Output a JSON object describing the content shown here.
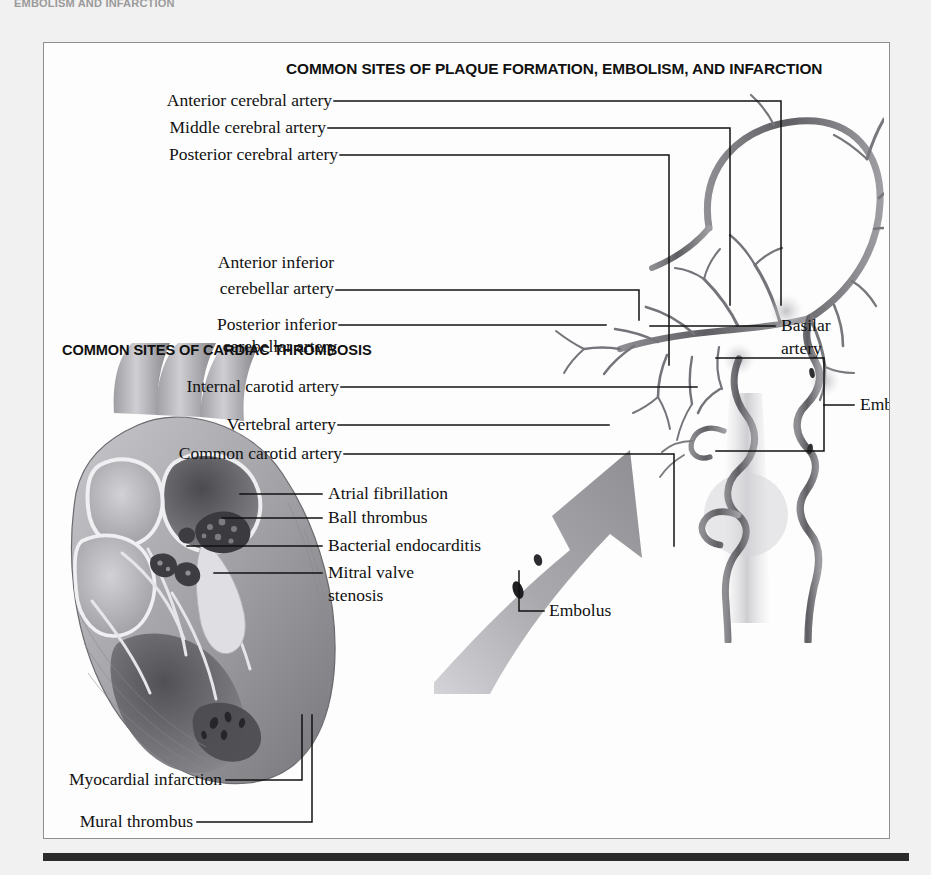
{
  "page": {
    "running_head": "EMBOLISM AND INFARCTION",
    "background_color": "#f1f1f1",
    "frame_color": "#8f8f93",
    "paper_color": "#fdfdfd",
    "rule_color": "#2b2b2b",
    "artery_color": "#6e6e72",
    "arrow_color": "#9a9a9e"
  },
  "headings": {
    "plaque": "COMMON SITES OF PLAQUE FORMATION, EMBOLISM, AND INFARCTION",
    "cardiac": "COMMON SITES OF CARDIAC THROMBOSIS"
  },
  "cerebral_labels": [
    {
      "text": "Anterior cerebral artery"
    },
    {
      "text": "Middle cerebral artery"
    },
    {
      "text": "Posterior cerebral artery"
    }
  ],
  "cerebellar_labels": [
    {
      "line1": "Anterior inferior",
      "line2": "cerebellar artery"
    },
    {
      "line1": "Posterior inferior",
      "line2": "cerebellar artery"
    }
  ],
  "carotid_labels": [
    {
      "text": "Internal carotid artery"
    },
    {
      "text": "Vertebral artery"
    },
    {
      "text": "Common carotid artery"
    }
  ],
  "right_labels": [
    {
      "line1": "Basilar",
      "line2": "artery"
    },
    {
      "line1": "Emboli",
      "line2": ""
    }
  ],
  "heart_labels": [
    {
      "line1": "Atrial fibrillation",
      "line2": ""
    },
    {
      "line1": "Ball thrombus",
      "line2": ""
    },
    {
      "line1": "Bacterial endocarditis",
      "line2": ""
    },
    {
      "line1": "Mitral valve",
      "line2": "stenosis"
    }
  ],
  "embolus_label": {
    "text": "Embolus"
  },
  "bottom_labels": [
    {
      "text": "Myocardial infarction"
    },
    {
      "text": "Mural thrombus"
    }
  ]
}
